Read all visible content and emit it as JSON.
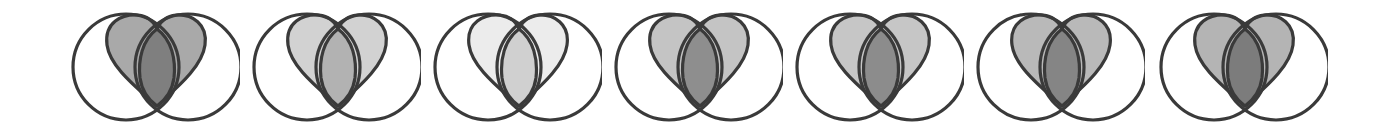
{
  "diagram": {
    "stroke_color": "#3a3a3a",
    "figures": [
      {
        "index": 1,
        "left": 60,
        "lobe_fill": "#a9a9a9",
        "lens_fill": "#7f7f7f"
      },
      {
        "index": 2,
        "left": 241,
        "lobe_fill": "#d2d2d2",
        "lens_fill": "#b2b2b2"
      },
      {
        "index": 3,
        "left": 422,
        "lobe_fill": "#ececec",
        "lens_fill": "#d0d0d0"
      },
      {
        "index": 4,
        "left": 603,
        "lobe_fill": "#c4c4c4",
        "lens_fill": "#8e8e8e"
      },
      {
        "index": 5,
        "left": 784,
        "lobe_fill": "#c6c6c6",
        "lens_fill": "#8c8c8c"
      },
      {
        "index": 6,
        "left": 965,
        "lobe_fill": "#b9b9b9",
        "lens_fill": "#858585"
      },
      {
        "index": 7,
        "left": 1148,
        "lobe_fill": "#b4b4b4",
        "lens_fill": "#7c7c7c"
      }
    ]
  }
}
